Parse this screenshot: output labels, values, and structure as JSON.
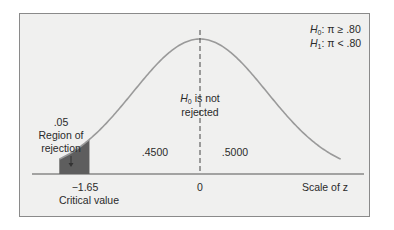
{
  "chart_data": {
    "type": "area",
    "title": "",
    "distribution": "standard normal",
    "xlabel": "Scale of z",
    "x_range": [
      -2.1,
      2.1
    ],
    "hypotheses": {
      "h0": {
        "sym": "H",
        "sub": "0",
        "text": ": π ≥ .80"
      },
      "h1": {
        "sym": "H",
        "sub": "1",
        "text": ": π < .80"
      }
    },
    "center": {
      "z": 0,
      "tick_label": "0"
    },
    "critical": {
      "z": -1.65,
      "tick_label": "−1.65",
      "caption": "Critical value"
    },
    "rejection_region": {
      "area_label": ".05",
      "line1": "Region of",
      "line2": "rejection",
      "from_z": -2.1,
      "to_z": -1.65
    },
    "areas": [
      {
        "label": ".4500",
        "from_z": -1.65,
        "to_z": 0
      },
      {
        "label": ".5000",
        "from_z": 0,
        "to_z": 2.1
      }
    ],
    "center_annotation": {
      "sym": "H",
      "sub": "0",
      "line1_rest": " is not",
      "line2": "rejected"
    },
    "colors": {
      "curve": "#9a9a9a",
      "shade": "#5e5e5e",
      "axis": "#555555",
      "text": "#2a2a2a"
    }
  }
}
